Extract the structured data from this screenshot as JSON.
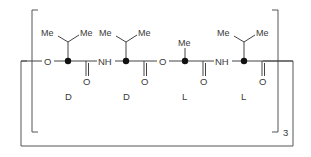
{
  "diagram": {
    "type": "chemical-structure",
    "atoms": {
      "ester_o1": "O",
      "nh1": "NH",
      "ester_o2": "O",
      "nh2": "NH",
      "carbonyl_o1": "O",
      "carbonyl_o2": "O",
      "carbonyl_o3": "O",
      "carbonyl_o4": "O"
    },
    "substituents": {
      "r1_me_left": "Me",
      "r1_me_right": "Me",
      "r2_me_left": "Me",
      "r2_me_right": "Me",
      "r3_me": "Me",
      "r4_me_left": "Me",
      "r4_me_right": "Me"
    },
    "stereo_labels": [
      "D",
      "D",
      "L",
      "L"
    ],
    "repeat_count": "3"
  }
}
